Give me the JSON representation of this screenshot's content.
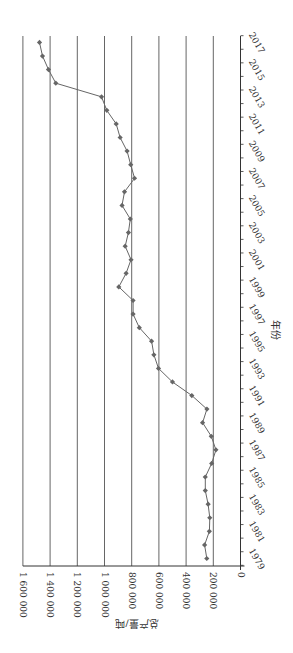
{
  "chart_data": {
    "type": "line",
    "title": "",
    "xlabel": "年份",
    "ylabel": "总产量/吨",
    "orientation": "rotated-90-clockwise",
    "x": [
      1979,
      1980,
      1981,
      1982,
      1983,
      1984,
      1985,
      1986,
      1987,
      1988,
      1989,
      1990,
      1991,
      1992,
      1993,
      1994,
      1995,
      1996,
      1997,
      1998,
      1999,
      2000,
      2001,
      2002,
      2003,
      2004,
      2005,
      2006,
      2007,
      2008,
      2009,
      2010,
      2011,
      2012,
      2013,
      2014,
      2015,
      2016,
      2017
    ],
    "x_tick_labels": [
      "1979",
      "1981",
      "1983",
      "1985",
      "1987",
      "1989",
      "1991",
      "1993",
      "1995",
      "1997",
      "1999",
      "2001",
      "2003",
      "2005",
      "2007",
      "2009",
      "2011",
      "2013",
      "2015",
      "2017"
    ],
    "series": [
      {
        "name": "总产量",
        "color": "#666666",
        "marker": "diamond",
        "values": [
          248000,
          264000,
          229000,
          226000,
          238000,
          259000,
          259000,
          212000,
          181000,
          215000,
          279000,
          247000,
          358000,
          500000,
          603000,
          637000,
          654000,
          744000,
          790000,
          790000,
          895000,
          841000,
          805000,
          848000,
          824000,
          810000,
          871000,
          853000,
          779000,
          807000,
          834000,
          885000,
          914000,
          983000,
          1022000,
          1358000,
          1412000,
          1456000,
          1478000
        ]
      }
    ],
    "y_ticks": [
      0,
      200000,
      400000,
      600000,
      800000,
      1000000,
      1200000,
      1400000,
      1600000
    ],
    "y_tick_labels": [
      "0",
      "200 000",
      "400 000",
      "600 000",
      "800 000",
      "1 000 000",
      "1 200 000",
      "1 400 000",
      "1 600 000"
    ],
    "ylim": [
      0,
      1600000
    ],
    "grid": true,
    "legend": "none"
  }
}
